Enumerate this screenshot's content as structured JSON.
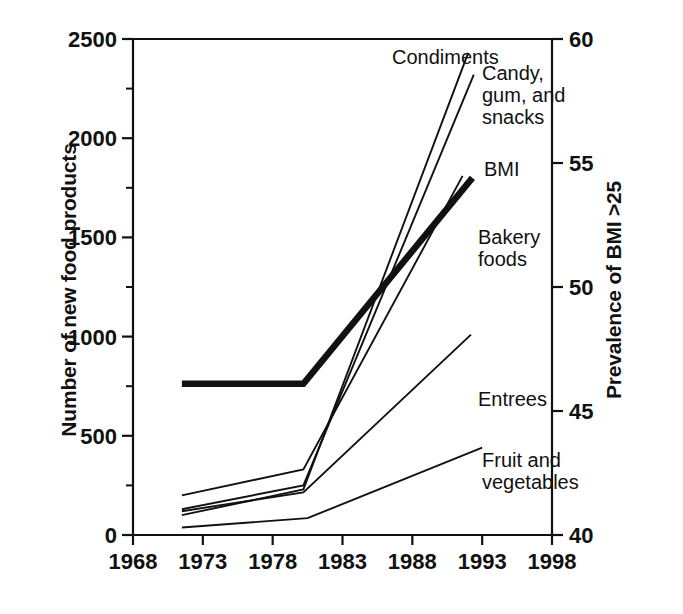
{
  "chart_data": {
    "type": "line",
    "title": "",
    "subtitle": "",
    "xlabel": "",
    "ylabel": "Number of new food products",
    "ylabel_right": "Prevalence of BMI >25",
    "xlim": [
      1968,
      1998
    ],
    "ylim": [
      0,
      2500
    ],
    "ylim_right": [
      40,
      60
    ],
    "grid": false,
    "legend_position": "inline-right-of-line-ends",
    "x_ticks": [
      "1968",
      "1973",
      "1978",
      "1983",
      "1988",
      "1993",
      "1998"
    ],
    "x_tick_values": [
      1968,
      1973,
      1978,
      1983,
      1988,
      1993,
      1998
    ],
    "y_ticks_left": [
      "0",
      "500",
      "1000",
      "1500",
      "2000",
      "2500"
    ],
    "y_tick_values_left": [
      0,
      500,
      1000,
      1500,
      2000,
      2500
    ],
    "y_minor_ticks_left": [
      250,
      750,
      1250,
      1750,
      2250
    ],
    "y_ticks_right": [
      "40",
      "45",
      "50",
      "55",
      "60"
    ],
    "y_tick_values_right": [
      40,
      45,
      50,
      55,
      60
    ],
    "series": [
      {
        "name": "Condiments",
        "axis": "left",
        "style": "thin",
        "x": [
          1971.5,
          1980.2,
          1992.0
        ],
        "values": [
          100,
          230,
          2430
        ]
      },
      {
        "name": "Candy, gum, and snacks",
        "axis": "left",
        "style": "thin",
        "x": [
          1971.5,
          1980.2,
          1992.4
        ],
        "values": [
          130,
          250,
          2320
        ]
      },
      {
        "name": "BMI",
        "axis": "right",
        "style": "thick",
        "x": [
          1971.5,
          1980.2,
          1992.3
        ],
        "values": [
          46.1,
          46.1,
          54.4
        ]
      },
      {
        "name": "Bakery foods",
        "axis": "left",
        "style": "thin",
        "x": [
          1971.5,
          1980.2,
          1991.6
        ],
        "values": [
          200,
          330,
          1810
        ]
      },
      {
        "name": "Entrees",
        "axis": "left",
        "style": "thin",
        "x": [
          1971.5,
          1980.2,
          1992.2
        ],
        "values": [
          120,
          215,
          1010
        ]
      },
      {
        "name": "Fruit and vegetables",
        "axis": "left",
        "style": "thin",
        "x": [
          1971.5,
          1980.5,
          1993.0
        ],
        "values": [
          38,
          85,
          440
        ]
      }
    ],
    "annotations": [
      {
        "text": "Condiments",
        "x_px": 392,
        "y_px": 64,
        "anchor": "start"
      },
      {
        "text": "Candy,",
        "x_px": 482,
        "y_px": 80,
        "anchor": "start"
      },
      {
        "text": "gum, and",
        "x_px": 482,
        "y_px": 102,
        "anchor": "start"
      },
      {
        "text": "snacks",
        "x_px": 482,
        "y_px": 124,
        "anchor": "start"
      },
      {
        "text": "BMI",
        "x_px": 484,
        "y_px": 176,
        "anchor": "start"
      },
      {
        "text": "Bakery",
        "x_px": 478,
        "y_px": 244,
        "anchor": "start"
      },
      {
        "text": "foods",
        "x_px": 478,
        "y_px": 266,
        "anchor": "start"
      },
      {
        "text": "Entrees",
        "x_px": 478,
        "y_px": 406,
        "anchor": "start"
      },
      {
        "text": "Fruit and",
        "x_px": 482,
        "y_px": 467,
        "anchor": "start"
      },
      {
        "text": "vegetables",
        "x_px": 482,
        "y_px": 489,
        "anchor": "start"
      }
    ],
    "colors": {
      "line": "#111111",
      "axis": "#111111",
      "text": "#111111",
      "background": "#ffffff"
    }
  }
}
